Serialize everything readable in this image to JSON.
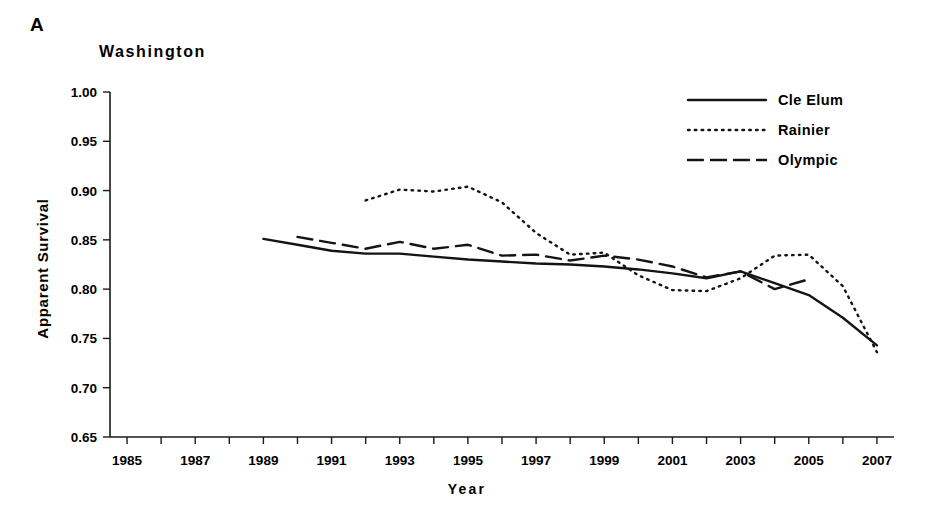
{
  "panel": {
    "letter": "A",
    "title": "Washington"
  },
  "axes": {
    "xlabel": "Year",
    "ylabel": "Apparent Survival",
    "ylim": [
      0.65,
      1.0
    ],
    "yticks": [
      "0.65",
      "0.70",
      "0.75",
      "0.80",
      "0.85",
      "0.90",
      "0.95",
      "1.00"
    ],
    "xlim": [
      1984.5,
      2007.5
    ],
    "xticks_labeled": [
      "1985",
      "1987",
      "1989",
      "1991",
      "1993",
      "1995",
      "1997",
      "1999",
      "2001",
      "2003",
      "2005",
      "2007"
    ],
    "grid": false
  },
  "legend": {
    "position": "top-right",
    "entries": [
      {
        "label": "Cle Elum",
        "style": "solid"
      },
      {
        "label": "Rainier",
        "style": "dotted"
      },
      {
        "label": "Olympic",
        "style": "dashed"
      }
    ]
  },
  "chart_data": {
    "type": "line",
    "title": "Washington",
    "xlabel": "Year",
    "ylabel": "Apparent Survival",
    "ylim": [
      0.65,
      1.0
    ],
    "xlim": [
      1984.5,
      2007.5
    ],
    "grid": false,
    "legend_position": "top-right",
    "series": [
      {
        "name": "Cle Elum",
        "style": "solid",
        "x": [
          1989,
          1990,
          1991,
          1992,
          1993,
          1994,
          1995,
          1996,
          1997,
          1998,
          1999,
          2000,
          2001,
          2002,
          2003,
          2004,
          2005,
          2006,
          2007
        ],
        "values": [
          0.851,
          0.845,
          0.839,
          0.836,
          0.836,
          0.833,
          0.83,
          0.828,
          0.826,
          0.825,
          0.823,
          0.82,
          0.816,
          0.811,
          0.818,
          0.806,
          0.794,
          0.771,
          0.743
        ]
      },
      {
        "name": "Rainier",
        "style": "dotted",
        "x": [
          1992,
          1993,
          1994,
          1995,
          1996,
          1997,
          1998,
          1999,
          2000,
          2001,
          2002,
          2003,
          2004,
          2005,
          2006,
          2007
        ],
        "values": [
          0.89,
          0.901,
          0.899,
          0.904,
          0.888,
          0.857,
          0.835,
          0.837,
          0.814,
          0.799,
          0.798,
          0.811,
          0.834,
          0.835,
          0.803,
          0.736
        ]
      },
      {
        "name": "Olympic",
        "style": "dashed",
        "x": [
          1990,
          1991,
          1992,
          1993,
          1994,
          1995,
          1996,
          1997,
          1998,
          1999,
          2000,
          2001,
          2002,
          2003,
          2004,
          2005
        ],
        "values": [
          0.853,
          0.847,
          0.841,
          0.848,
          0.841,
          0.845,
          0.834,
          0.835,
          0.829,
          0.834,
          0.83,
          0.823,
          0.812,
          0.818,
          0.8,
          0.81
        ]
      }
    ]
  }
}
